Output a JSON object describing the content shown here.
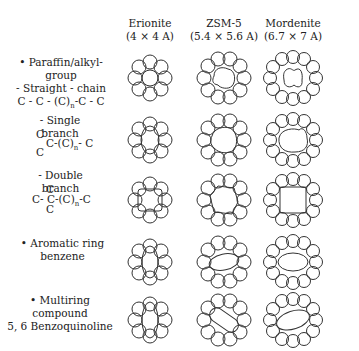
{
  "columns": [
    {
      "name": "Erionite",
      "size": "(4 × 4 A)"
    },
    {
      "name": "ZSM-5",
      "size": "(5.4 × 5.6 A)"
    },
    {
      "name": "Mordenite",
      "size": "(6.7 × 7 A)"
    }
  ],
  "rows": [
    {
      "line1": "• Paraffin/alkyl-group",
      "line2": "- Straight - chain",
      "formula": "C - C - (C)n-C - C"
    },
    {
      "line1": "- Single branch",
      "formula_top": "C",
      "formula_mid": "C-(C)n- C",
      "formula_bot": "C"
    },
    {
      "line1": "- Double branch",
      "formula_top": "C",
      "formula_mid": "C- C-(C)n-C",
      "formula_bot": "C"
    },
    {
      "line1": "• Aromatic ring",
      "line2": "benzene"
    },
    {
      "line1": "• Multiring compound",
      "line2": "5, 6 Benzoquinoline"
    }
  ]
}
